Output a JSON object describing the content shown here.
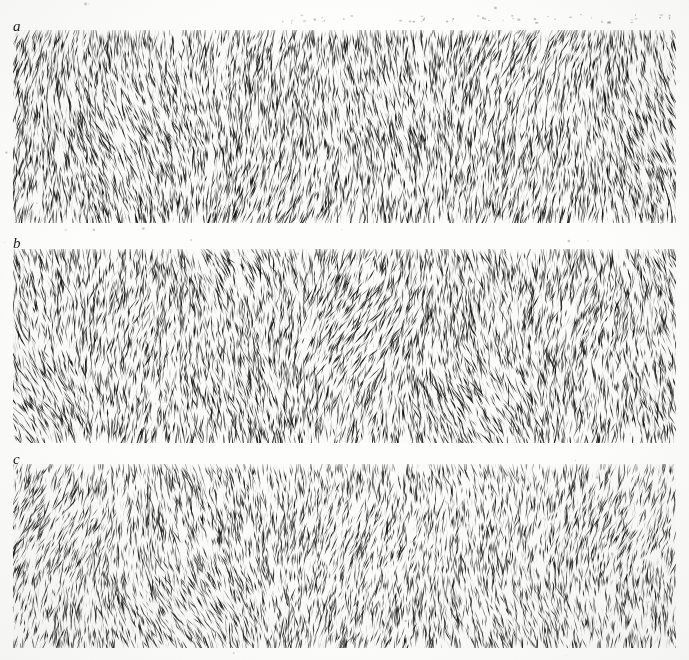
{
  "figure": {
    "kind": "texture-stimulus-figure",
    "background_color": "#fdfdfc",
    "paper_tint": "#fbfbf9",
    "ink_color": "#101010",
    "width": 689,
    "height": 660,
    "panel_count": 3
  },
  "panels": [
    {
      "label": "a",
      "label_x": 13,
      "label_y": 19,
      "x": 13,
      "y": 30,
      "width": 663,
      "height": 193,
      "element": "tapered-stroke",
      "description": "dense field of short tapered near-vertical strokes",
      "stroke_count": 5200,
      "mean_stroke_length": 13,
      "mean_stroke_width": 2.0,
      "base_angle_deg": 0,
      "angle_jitter_deg": 26,
      "density": 1.0,
      "ink_color": "#0d0d0d"
    },
    {
      "label": "b",
      "label_x": 13,
      "label_y": 236,
      "x": 13,
      "y": 249,
      "width": 663,
      "height": 194,
      "element": "tapered-stroke",
      "description": "dense field of short tapered near-vertical strokes, wider angular spread",
      "stroke_count": 5000,
      "mean_stroke_length": 13,
      "mean_stroke_width": 2.0,
      "base_angle_deg": 0,
      "angle_jitter_deg": 32,
      "density": 0.96,
      "ink_color": "#0d0d0d"
    },
    {
      "label": "c",
      "label_x": 13,
      "label_y": 452,
      "x": 13,
      "y": 464,
      "width": 663,
      "height": 184,
      "element": "tapered-stroke",
      "description": "dense field of short tapered near-vertical strokes, slightly sparser and lighter",
      "stroke_count": 4700,
      "mean_stroke_length": 12,
      "mean_stroke_width": 1.9,
      "base_angle_deg": 0,
      "angle_jitter_deg": 29,
      "density": 0.9,
      "ink_color": "#111111"
    }
  ],
  "artifacts": {
    "has_scan_speckle": true,
    "speckle_count": 120,
    "top_margin_marks": true
  }
}
